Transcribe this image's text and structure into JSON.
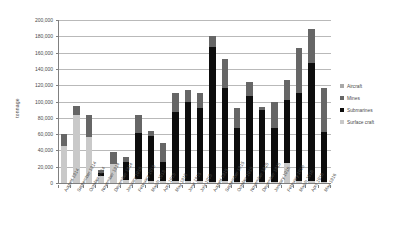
{
  "chart_data": {
    "type": "bar",
    "title": "",
    "subtitle": "",
    "xlabel": "",
    "ylabel": "tonnage",
    "ylim": [
      0,
      200000
    ],
    "ytick_step": 20000,
    "grid": true,
    "stacked": true,
    "legend_position": "right",
    "ytick_labels": [
      "200,000",
      "180,000",
      "160,000",
      "140,000",
      "120,000",
      "100,000",
      "80,000",
      "60,000",
      "40,000",
      "20,000",
      "0"
    ],
    "ytick_values": [
      200000,
      180000,
      160000,
      140000,
      120000,
      100000,
      80000,
      60000,
      40000,
      20000,
      0
    ],
    "categories": [
      "August 1914",
      "September 1914",
      "October 1914",
      "November 1914",
      "December 1914",
      "January 1915",
      "February 1915",
      "March 1915",
      "April 1915",
      "May 1915",
      "June 1915",
      "July 1915",
      "August 1915",
      "September 1915",
      "October 1915",
      "November 1915",
      "December 1915",
      "January 1916",
      "February 1916",
      "March 1916",
      "April 1916",
      "May 1916"
    ],
    "series": [
      {
        "name": "Surface craft",
        "color": "#c9c9c9",
        "values": [
          46000,
          83000,
          56000,
          8000,
          23000,
          4000,
          5000,
          2000,
          2000,
          3000,
          3000,
          2000,
          1000,
          2000,
          1000,
          1000,
          1000,
          1000,
          24000,
          2000,
          2000,
          1000
        ]
      },
      {
        "name": "Submarines",
        "color": "#0d0d0d",
        "values": [
          0,
          0,
          0,
          4000,
          0,
          22000,
          56000,
          56000,
          24000,
          84000,
          96000,
          90000,
          166000,
          114000,
          66000,
          106000,
          88000,
          66000,
          78000,
          108000,
          145000,
          62000
        ]
      },
      {
        "name": "Mines",
        "color": "#666666",
        "values": [
          14000,
          12000,
          28000,
          4000,
          15000,
          6000,
          23000,
          6000,
          23000,
          24000,
          15000,
          18000,
          14000,
          36000,
          25000,
          17000,
          4000,
          33000,
          25000,
          56000,
          42000,
          53000
        ]
      },
      {
        "name": "Aircraft",
        "color": "#a8a8a8",
        "values": [
          0,
          0,
          0,
          0,
          0,
          0,
          0,
          0,
          0,
          0,
          0,
          0,
          0,
          0,
          0,
          0,
          0,
          0,
          0,
          0,
          0,
          0
        ]
      }
    ]
  },
  "legend": {
    "items": [
      {
        "label": "Aircraft",
        "color": "#a8a8a8"
      },
      {
        "label": "Mines",
        "color": "#666666"
      },
      {
        "label": "Submarines",
        "color": "#0d0d0d"
      },
      {
        "label": "Surface craft",
        "color": "#c9c9c9"
      }
    ]
  }
}
